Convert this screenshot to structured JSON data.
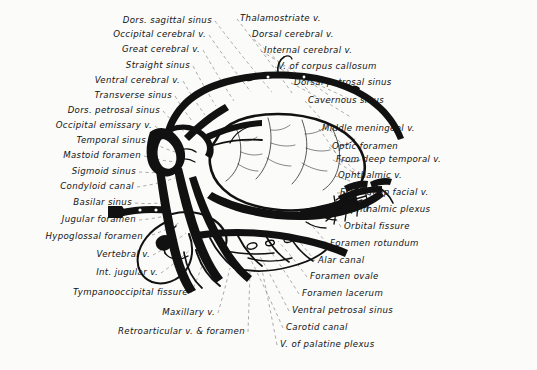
{
  "figure": {
    "kind": "anatomical-illustration",
    "style": "black ink line drawing with dashed leader lines",
    "background_color": "#fbfbfa",
    "ink_color": "#111111",
    "leader_color": "#7b7b7b"
  },
  "labels_left": [
    {
      "text": "Dors. sagittal sinus",
      "x": 212,
      "y": 16,
      "tx": 272,
      "ty": 92
    },
    {
      "text": "Occipital cerebral v.",
      "x": 206,
      "y": 30,
      "tx": 251,
      "ty": 92
    },
    {
      "text": "Great cerebral v.",
      "x": 200,
      "y": 45,
      "tx": 234,
      "ty": 101
    },
    {
      "text": "Straight sinus",
      "x": 190,
      "y": 61,
      "tx": 216,
      "ty": 106
    },
    {
      "text": "Ventral cerebral v.",
      "x": 180,
      "y": 76,
      "tx": 205,
      "ty": 115
    },
    {
      "text": "Transverse sinus",
      "x": 172,
      "y": 91,
      "tx": 193,
      "ty": 122
    },
    {
      "text": "Dors. petrosal sinus",
      "x": 160,
      "y": 106,
      "tx": 186,
      "ty": 133
    },
    {
      "text": "Occipital emissary v.",
      "x": 152,
      "y": 121,
      "tx": 180,
      "ty": 143
    },
    {
      "text": "Temporal sinus",
      "x": 146,
      "y": 136,
      "tx": 179,
      "ty": 153
    },
    {
      "text": "Mastoid foramen",
      "x": 141,
      "y": 151,
      "tx": 178,
      "ty": 162
    },
    {
      "text": "Sigmoid sinus",
      "x": 136,
      "y": 167,
      "tx": 176,
      "ty": 171
    },
    {
      "text": "Condyloid canal",
      "x": 134,
      "y": 182,
      "tx": 175,
      "ty": 178
    },
    {
      "text": "Basilar sinus",
      "x": 132,
      "y": 198,
      "tx": 168,
      "ty": 202
    },
    {
      "text": "Jugular foramen",
      "x": 136,
      "y": 215,
      "tx": 177,
      "ty": 213
    },
    {
      "text": "Hypoglossal foramen",
      "x": 143,
      "y": 232,
      "tx": 181,
      "ty": 222
    },
    {
      "text": "Vertebral v.",
      "x": 150,
      "y": 250,
      "tx": 186,
      "ty": 233
    },
    {
      "text": "Int. jugular v.",
      "x": 158,
      "y": 268,
      "tx": 193,
      "ty": 247
    },
    {
      "text": "Tympanooccipital fissure",
      "x": 188,
      "y": 288,
      "tx": 205,
      "ty": 258
    },
    {
      "text": "Maxillary v.",
      "x": 215,
      "y": 308,
      "tx": 230,
      "ty": 268
    },
    {
      "text": "Retroarticular v. & foramen",
      "x": 245,
      "y": 327,
      "tx": 250,
      "ty": 272
    }
  ],
  "labels_right": [
    {
      "text": "Thalamostriate v.",
      "x": 240,
      "y": 14,
      "tx": 292,
      "ty": 93
    },
    {
      "text": "Dorsal cerebral v.",
      "x": 252,
      "y": 30,
      "tx": 310,
      "ty": 92
    },
    {
      "text": "Internal cerebral v.",
      "x": 264,
      "y": 46,
      "tx": 330,
      "ty": 96
    },
    {
      "text": "V. of corpus callosum",
      "x": 278,
      "y": 62,
      "tx": 351,
      "ty": 100
    },
    {
      "text": "Dorsal petrosal sinus",
      "x": 294,
      "y": 78,
      "tx": 352,
      "ty": 118
    },
    {
      "text": "Cavernous sinus",
      "x": 308,
      "y": 96,
      "tx": 346,
      "ty": 150
    },
    {
      "text": "Middle meningeal v.",
      "x": 322,
      "y": 124,
      "tx": 344,
      "ty": 166
    },
    {
      "text": "Optic foramen",
      "x": 332,
      "y": 142,
      "tx": 360,
      "ty": 176
    },
    {
      "text": "From deep temporal v.",
      "x": 336,
      "y": 155,
      "tx": 366,
      "ty": 182
    },
    {
      "text": "Ophthalmic v.",
      "x": 338,
      "y": 171,
      "tx": 370,
      "ty": 190
    },
    {
      "text": "From deep facial v.",
      "x": 340,
      "y": 188,
      "tx": 372,
      "ty": 196
    },
    {
      "text": "Ophthalmic plexus",
      "x": 344,
      "y": 205,
      "tx": 352,
      "ty": 204
    },
    {
      "text": "Orbital fissure",
      "x": 344,
      "y": 222,
      "tx": 330,
      "ty": 212
    },
    {
      "text": "Foramen rotundum",
      "x": 330,
      "y": 239,
      "tx": 308,
      "ty": 222
    },
    {
      "text": "Alar canal",
      "x": 318,
      "y": 256,
      "tx": 290,
      "ty": 232
    },
    {
      "text": "Foramen ovale",
      "x": 310,
      "y": 272,
      "tx": 278,
      "ty": 241
    },
    {
      "text": "Foramen lacerum",
      "x": 302,
      "y": 289,
      "tx": 268,
      "ty": 248
    },
    {
      "text": "Ventral petrosal sinus",
      "x": 292,
      "y": 306,
      "tx": 258,
      "ty": 253
    },
    {
      "text": "Carotid canal",
      "x": 286,
      "y": 323,
      "tx": 250,
      "ty": 258
    },
    {
      "text": "V. of palatine plexus",
      "x": 280,
      "y": 340,
      "tx": 262,
      "ty": 270
    }
  ]
}
